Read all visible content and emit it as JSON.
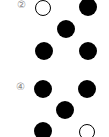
{
  "options": [
    {
      "label": "②",
      "label_pos": [
        17,
        0
      ],
      "dots": [
        {
          "cx": 43,
          "cy": 8,
          "r": 8,
          "type": "open"
        },
        {
          "cx": 88,
          "cy": 7,
          "r": 9,
          "type": "filled"
        },
        {
          "cx": 66,
          "cy": 29,
          "r": 9,
          "type": "filled"
        },
        {
          "cx": 44,
          "cy": 51,
          "r": 9,
          "type": "filled"
        },
        {
          "cx": 88,
          "cy": 51,
          "r": 9,
          "type": "filled"
        }
      ]
    },
    {
      "label": "④",
      "label_pos": [
        16,
        82
      ],
      "dots": [
        {
          "cx": 43,
          "cy": 89,
          "r": 9,
          "type": "filled"
        },
        {
          "cx": 87,
          "cy": 89,
          "r": 9,
          "type": "filled"
        },
        {
          "cx": 65,
          "cy": 110,
          "r": 9,
          "type": "filled"
        },
        {
          "cx": 43,
          "cy": 131,
          "r": 9,
          "type": "filled"
        },
        {
          "cx": 87,
          "cy": 132,
          "r": 8,
          "type": "open"
        }
      ]
    }
  ],
  "colors": {
    "filled": "#000000",
    "open_border": "#000000",
    "label": "#888888"
  }
}
